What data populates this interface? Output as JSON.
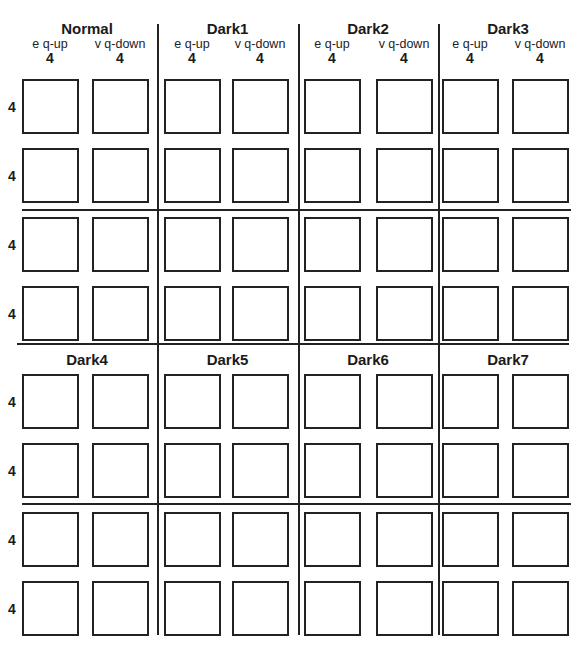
{
  "header_groups": [
    {
      "title": "Normal",
      "columns": [
        {
          "label": "e  q-up",
          "value": "4"
        },
        {
          "label": "v  q-down",
          "value": "4"
        }
      ]
    },
    {
      "title": "Dark1",
      "columns": [
        {
          "label": "e  q-up",
          "value": "4"
        },
        {
          "label": "v  q-down",
          "value": "4"
        }
      ]
    },
    {
      "title": "Dark2",
      "columns": [
        {
          "label": "e  q-up",
          "value": "4"
        },
        {
          "label": "v  q-down",
          "value": "4"
        }
      ]
    },
    {
      "title": "Dark3",
      "columns": [
        {
          "label": "e  q-up",
          "value": "4"
        },
        {
          "label": "v  q-down",
          "value": "4"
        }
      ]
    }
  ],
  "lower_groups": [
    {
      "title": "Dark4"
    },
    {
      "title": "Dark5"
    },
    {
      "title": "Dark6"
    },
    {
      "title": "Dark7"
    }
  ],
  "row_labels": [
    "4",
    "4",
    "4",
    "4",
    "4",
    "4",
    "4",
    "4"
  ],
  "colors": {
    "line": "#222222",
    "background": "#ffffff"
  }
}
